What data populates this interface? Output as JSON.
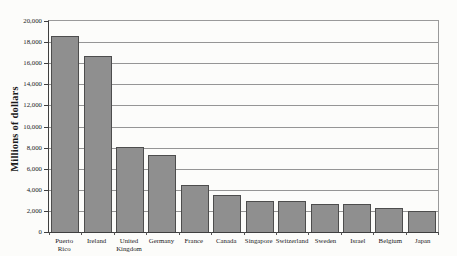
{
  "chart_data": {
    "type": "bar",
    "title": "",
    "xlabel": "",
    "ylabel": "Millions of dollars",
    "ylim": [
      0,
      20000
    ],
    "ytick_interval": 2000,
    "ytick_labels": [
      "20,000",
      "18,000",
      "16,000",
      "14,000",
      "12,000",
      "10,000",
      "8,000",
      "6,000",
      "4,000",
      "2,000",
      "0"
    ],
    "categories": [
      "Puerto Rico",
      "Ireland",
      "United Kingdom",
      "Germany",
      "France",
      "Canada",
      "Singapore",
      "Switzerland",
      "Sweden",
      "Israel",
      "Belgium",
      "Japan"
    ],
    "values": [
      18600,
      16700,
      8100,
      7300,
      4500,
      3500,
      2900,
      2900,
      2700,
      2700,
      2300,
      2000
    ],
    "grid": "horizontal",
    "legend_position": "none",
    "colors": {
      "bar_fill": "#8f8f8f",
      "bar_border": "#4d4d4d",
      "gridline": "#959595",
      "axis": "#3f3f3f",
      "text": "#1a1a1a",
      "background": "#fcfcfa"
    }
  }
}
